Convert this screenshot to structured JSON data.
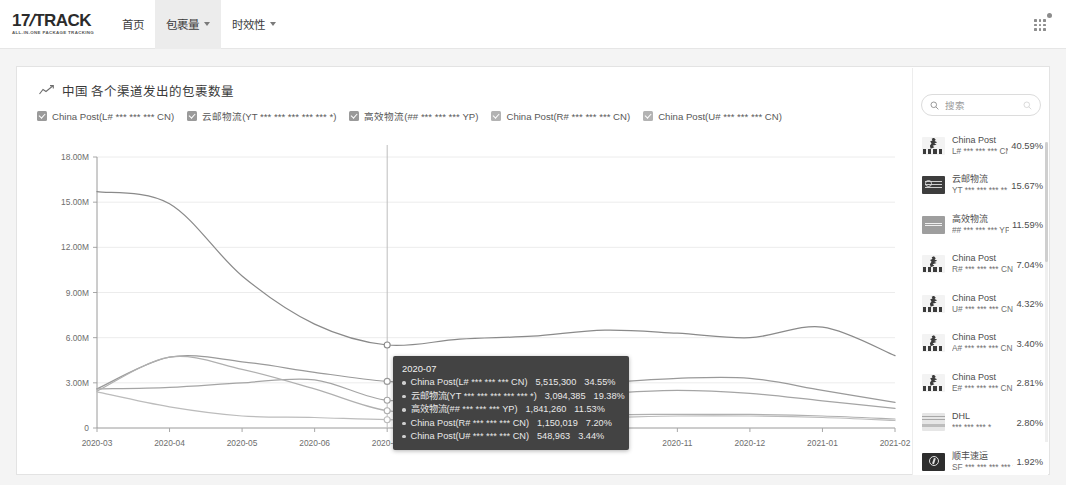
{
  "header": {
    "logo_main": "17",
    "logo_slash": "/",
    "logo_track": "TRACK",
    "logo_tagline": "ALL-IN-ONE PACKAGE TRACKING",
    "nav": [
      {
        "label": "首页",
        "active": false,
        "caret": false
      },
      {
        "label": "包裹量",
        "active": true,
        "caret": true
      },
      {
        "label": "时效性",
        "active": false,
        "caret": true
      }
    ],
    "apps_icon": "grid-apps-icon"
  },
  "chart_panel": {
    "title": "中国 各个渠道发出的包裹数量",
    "trend_icon": "trend-line-icon",
    "legend": [
      {
        "label": "China Post(L# *** *** *** CN)",
        "checked": true
      },
      {
        "label": "云邮物流(YT *** *** *** *** *** *)",
        "checked": true
      },
      {
        "label": "高效物流(## *** *** *** YP)",
        "checked": true
      },
      {
        "label": "China Post(R# *** *** *** CN)",
        "checked": true
      },
      {
        "label": "China Post(U# *** *** *** CN)",
        "checked": true
      }
    ]
  },
  "tooltip": {
    "date": "2020-07",
    "rows": [
      {
        "name": "China Post(L# *** *** *** CN)",
        "value": "5,515,300",
        "pct": "34.55%"
      },
      {
        "name": "云邮物流(YT *** *** *** *** *** *)",
        "value": "3,094,385",
        "pct": "19.38%"
      },
      {
        "name": "高效物流(## *** *** *** YP)",
        "value": "1,841,260",
        "pct": "11.53%"
      },
      {
        "name": "China Post(R# *** *** *** CN)",
        "value": "1,150,019",
        "pct": "7.20%"
      },
      {
        "name": "China Post(U# *** *** *** CN)",
        "value": "548,963",
        "pct": "3.44%"
      }
    ]
  },
  "sidebar": {
    "search": {
      "placeholder": "搜索",
      "value": "",
      "icon": "search-icon",
      "clear_icon": "clear-icon"
    },
    "carriers": [
      {
        "name": "China Post",
        "code": "L# *** *** *** CN",
        "pct": "40.59%",
        "logo": "china-post-logo"
      },
      {
        "name": "云邮物流",
        "code": "YT *** *** *** ** _",
        "pct": "15.67%",
        "logo": "yunyou-logo"
      },
      {
        "name": "高效物流",
        "code": "## *** *** *** YP",
        "pct": "11.59%",
        "logo": "gaoxiao-logo"
      },
      {
        "name": "China Post",
        "code": "R# *** *** *** CN",
        "pct": "7.04%",
        "logo": "china-post-logo"
      },
      {
        "name": "China Post",
        "code": "U# *** *** *** CN",
        "pct": "4.32%",
        "logo": "china-post-logo"
      },
      {
        "name": "China Post",
        "code": "A# *** *** *** CN",
        "pct": "3.40%",
        "logo": "china-post-logo"
      },
      {
        "name": "China Post",
        "code": "E# *** *** *** CN",
        "pct": "2.81%",
        "logo": "china-post-logo"
      },
      {
        "name": "DHL",
        "code": "*** *** *** *",
        "pct": "2.80%",
        "logo": "dhl-logo"
      },
      {
        "name": "顺丰速运",
        "code": "SF *** *** *** *** *",
        "pct": "1.92%",
        "logo": "sf-logo"
      }
    ]
  },
  "chart_data": {
    "type": "line",
    "title": "中国 各个渠道发出的包裹数量",
    "xlabel": "",
    "ylabel": "",
    "ylim": [
      0,
      18000000
    ],
    "yticks": [
      0,
      3000000,
      6000000,
      9000000,
      12000000,
      15000000,
      18000000
    ],
    "ytick_labels": [
      "0",
      "3.00M",
      "6.00M",
      "9.00M",
      "12.00M",
      "15.00M",
      "18.00M"
    ],
    "grid": true,
    "legend_position": "top",
    "categories": [
      "2020-03",
      "2020-04",
      "2020-05",
      "2020-06",
      "2020-07",
      "2020-08",
      "2020-09",
      "2020-10",
      "2020-11",
      "2020-12",
      "2021-01",
      "2021-02"
    ],
    "series": [
      {
        "name": "China Post(L# *** *** *** CN)",
        "color": "#8a8a8a",
        "values": [
          15700000,
          14900000,
          10100000,
          6900000,
          5515300,
          5900000,
          6100000,
          6500000,
          6300000,
          6000000,
          6700000,
          4800000
        ]
      },
      {
        "name": "云邮物流(YT *** *** *** *** *** *)",
        "color": "#9a9a9a",
        "values": [
          2600000,
          4700000,
          4400000,
          3700000,
          3094385,
          2900000,
          2700000,
          3000000,
          3300000,
          3300000,
          2500000,
          1700000
        ]
      },
      {
        "name": "高效物流(## *** *** *** YP)",
        "color": "#a5a5a5",
        "values": [
          2600000,
          2700000,
          3000000,
          3200000,
          1841260,
          2200000,
          2100000,
          2300000,
          2500000,
          2300000,
          1800000,
          1300000
        ]
      },
      {
        "name": "China Post(R# *** *** *** CN)",
        "color": "#b0b0b0",
        "values": [
          2450000,
          4700000,
          3900000,
          2600000,
          1150019,
          1100000,
          1000000,
          900000,
          900000,
          900000,
          800000,
          600000
        ]
      },
      {
        "name": "China Post(U# *** *** *** CN)",
        "color": "#bcbcbc",
        "values": [
          2400000,
          1400000,
          800000,
          700000,
          548963,
          600000,
          650000,
          700000,
          800000,
          800000,
          700000,
          500000
        ]
      }
    ],
    "marker_x": "2020-07"
  }
}
